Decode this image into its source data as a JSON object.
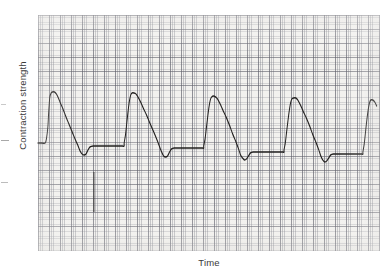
{
  "figure": {
    "kind": "chart-recorder-trace",
    "y_axis_label": "Contraction strength",
    "x_axis_label": "Time"
  },
  "chart_data": {
    "type": "line",
    "title": "",
    "subtitle": "",
    "xlabel": "Time",
    "ylabel": "Contraction strength",
    "xlim": [
      0,
      342
    ],
    "ylim": [
      236,
      0
    ],
    "grid": true,
    "grid_style": "chart recorder paper, fine minor lines every ~2.2 px, darker major lines every ~11 px horizontally and ~14 px vertically",
    "legend": "none",
    "tick_labels_x": [],
    "tick_labels_y": [],
    "axis_units": "arbitrary (uncalibrated recorder tracing)",
    "baseline_y": 128,
    "plateau_y": 131,
    "series": [
      {
        "name": "contraction trace",
        "color": "#22201f",
        "points": [
          [
            0,
            128
          ],
          [
            6,
            128
          ],
          [
            11,
            128
          ],
          [
            13,
            123
          ],
          [
            15,
            112
          ],
          [
            16,
            100
          ],
          [
            17,
            90
          ],
          [
            18,
            82
          ],
          [
            20,
            78
          ],
          [
            22,
            77
          ],
          [
            25,
            77
          ],
          [
            28,
            79
          ],
          [
            31,
            83
          ],
          [
            34,
            88
          ],
          [
            38,
            94
          ],
          [
            42,
            101
          ],
          [
            47,
            109
          ],
          [
            52,
            117
          ],
          [
            57,
            125
          ],
          [
            61,
            131
          ],
          [
            64,
            136
          ],
          [
            67,
            139
          ],
          [
            70,
            140
          ],
          [
            73,
            139
          ],
          [
            76,
            135
          ],
          [
            79,
            132
          ],
          [
            84,
            131
          ],
          [
            92,
            131
          ],
          [
            104,
            131
          ],
          [
            117,
            131
          ],
          [
            128,
            131
          ],
          [
            131,
            131
          ],
          [
            131,
            128
          ],
          [
            133,
            120
          ],
          [
            135,
            108
          ],
          [
            137,
            96
          ],
          [
            139,
            86
          ],
          [
            141,
            80
          ],
          [
            143,
            78
          ],
          [
            146,
            78
          ],
          [
            149,
            79
          ],
          [
            152,
            82
          ],
          [
            156,
            87
          ],
          [
            160,
            93
          ],
          [
            165,
            100
          ],
          [
            170,
            108
          ],
          [
            176,
            117
          ],
          [
            181,
            125
          ],
          [
            185,
            132
          ],
          [
            188,
            137
          ],
          [
            191,
            141
          ],
          [
            194,
            142
          ],
          [
            197,
            141
          ],
          [
            200,
            137
          ],
          [
            203,
            134
          ],
          [
            207,
            133
          ],
          [
            214,
            133
          ],
          [
            225,
            133
          ],
          [
            238,
            133
          ],
          [
            248,
            133
          ],
          [
            252,
            133
          ],
          [
            252,
            131
          ],
          [
            254,
            124
          ],
          [
            256,
            113
          ],
          [
            258,
            102
          ],
          [
            260,
            92
          ],
          [
            262,
            85
          ],
          [
            264,
            82
          ],
          [
            267,
            81
          ],
          [
            270,
            82
          ],
          [
            273,
            84
          ],
          [
            277,
            89
          ],
          [
            281,
            95
          ],
          [
            286,
            102
          ],
          [
            291,
            110
          ],
          [
            296,
            119
          ],
          [
            301,
            127
          ],
          [
            305,
            134
          ],
          [
            308,
            140
          ],
          [
            311,
            143
          ],
          [
            314,
            145
          ],
          [
            317,
            144
          ],
          [
            320,
            141
          ],
          [
            323,
            138
          ],
          [
            327,
            137
          ],
          [
            334,
            137
          ],
          [
            345,
            137
          ],
          [
            358,
            137
          ],
          [
            370,
            137
          ],
          [
            374,
            137
          ],
          [
            374,
            135
          ],
          [
            376,
            128
          ],
          [
            378,
            117
          ],
          [
            380,
            106
          ],
          [
            382,
            96
          ],
          [
            384,
            88
          ],
          [
            386,
            84
          ],
          [
            389,
            83
          ],
          [
            392,
            83
          ],
          [
            395,
            85
          ],
          [
            399,
            90
          ],
          [
            403,
            96
          ],
          [
            408,
            103
          ],
          [
            413,
            111
          ],
          [
            418,
            120
          ],
          [
            423,
            128
          ],
          [
            427,
            135
          ],
          [
            430,
            141
          ],
          [
            433,
            145
          ],
          [
            436,
            147
          ],
          [
            439,
            146
          ],
          [
            442,
            143
          ],
          [
            445,
            140
          ],
          [
            449,
            139
          ],
          [
            456,
            139
          ],
          [
            467,
            139
          ],
          [
            478,
            139
          ],
          [
            490,
            139
          ],
          [
            494,
            139
          ],
          [
            494,
            137
          ],
          [
            496,
            129
          ],
          [
            498,
            117
          ],
          [
            500,
            105
          ],
          [
            502,
            95
          ],
          [
            504,
            88
          ],
          [
            506,
            85
          ],
          [
            509,
            85
          ],
          [
            512,
            87
          ],
          [
            515,
            91
          ]
        ]
      }
    ],
    "event_marker": {
      "name": "stimulus marker",
      "x": 85,
      "y_top": 157,
      "y_bottom": 197,
      "description": "Short vertical event/stimulus marker drawn by the second recorder pen below the contraction trace."
    },
    "cycles": [
      {
        "index": 1,
        "peak_x": 22,
        "peak_y": 77,
        "trough_x": 70,
        "trough_y": 140,
        "plateau_y": 131
      },
      {
        "index": 2,
        "peak_x": 146,
        "peak_y": 78,
        "trough_x": 191,
        "trough_y": 142,
        "plateau_y": 133
      },
      {
        "index": 3,
        "peak_x": 267,
        "peak_y": 81,
        "trough_x": 314,
        "trough_y": 145,
        "plateau_y": 137
      },
      {
        "index": 4,
        "peak_x": 389,
        "peak_y": 83,
        "trough_x": 436,
        "trough_y": 147,
        "plateau_y": 139
      },
      {
        "index": 5,
        "peak_x": 509,
        "peak_y": 85,
        "trough_x": null,
        "trough_y": null,
        "plateau_y": null,
        "note": "partial cycle clipped at right edge of paper"
      }
    ]
  },
  "colors": {
    "trace": "#22201f",
    "paper": "#f2f1ee",
    "grid_major": "#5f5f69",
    "grid_minor": "#787a84",
    "label_text": "#3a3a3a"
  }
}
